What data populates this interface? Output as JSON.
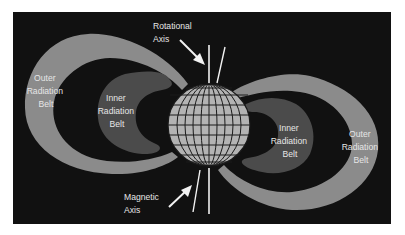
{
  "diagram": {
    "colors": {
      "background": "#111111",
      "outer_belt": "#8b8b8b",
      "inner_belt": "#4b4b4b",
      "globe_fill": "#b3b3b3",
      "globe_grid": "#1a1a1a",
      "axis_lines": "#f2f2f2",
      "label_text": "#e6e6e6"
    },
    "labels": {
      "rotational_axis": [
        "Rotational",
        "Axis"
      ],
      "magnetic_axis": [
        "Magnetic",
        "Axis"
      ],
      "outer_left": [
        "Outer",
        "Radiation",
        "Belt"
      ],
      "inner_left": [
        "Inner",
        "Radiation",
        "Belt"
      ],
      "inner_right": [
        "Inner",
        "Radiation",
        "Belt"
      ],
      "outer_right": [
        "Outer",
        "Radiation",
        "Belt"
      ]
    },
    "elements": {
      "earth": "globe with latitude/longitude grid",
      "rotational_axis": "vertical line through poles",
      "magnetic_axis": "tilted line through globe",
      "outer_belts": 2,
      "inner_belts": 2
    }
  }
}
